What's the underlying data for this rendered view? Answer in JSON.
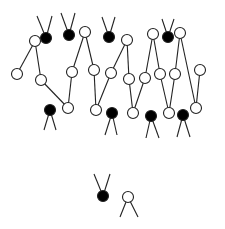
{
  "diagram": {
    "width": 225,
    "height": 229,
    "colors": {
      "stroke": "#222222",
      "black_fill": "#000000",
      "white_fill": "#ffffff",
      "background": "#ffffff"
    },
    "node_radius": 5.5,
    "nodes": [
      {
        "id": "b1",
        "x": 46,
        "y": 38,
        "fill": "black"
      },
      {
        "id": "b2",
        "x": 69,
        "y": 35,
        "fill": "black"
      },
      {
        "id": "b3",
        "x": 109,
        "y": 37,
        "fill": "black"
      },
      {
        "id": "b4",
        "x": 168,
        "y": 37,
        "fill": "black"
      },
      {
        "id": "w1",
        "x": 35,
        "y": 41,
        "fill": "white"
      },
      {
        "id": "w2",
        "x": 85,
        "y": 32,
        "fill": "white"
      },
      {
        "id": "w3",
        "x": 127,
        "y": 40,
        "fill": "white"
      },
      {
        "id": "w4",
        "x": 153,
        "y": 34,
        "fill": "white"
      },
      {
        "id": "w5",
        "x": 180,
        "y": 33,
        "fill": "white"
      },
      {
        "id": "w6",
        "x": 17,
        "y": 74,
        "fill": "white"
      },
      {
        "id": "w7",
        "x": 41,
        "y": 80,
        "fill": "white"
      },
      {
        "id": "w8",
        "x": 72,
        "y": 72,
        "fill": "white"
      },
      {
        "id": "w9",
        "x": 94,
        "y": 70,
        "fill": "white"
      },
      {
        "id": "w10",
        "x": 111,
        "y": 73,
        "fill": "white"
      },
      {
        "id": "w11",
        "x": 129,
        "y": 79,
        "fill": "white"
      },
      {
        "id": "w12",
        "x": 145,
        "y": 78,
        "fill": "white"
      },
      {
        "id": "w13",
        "x": 160,
        "y": 74,
        "fill": "white"
      },
      {
        "id": "w14",
        "x": 175,
        "y": 74,
        "fill": "white"
      },
      {
        "id": "w15",
        "x": 200,
        "y": 70,
        "fill": "white"
      },
      {
        "id": "w16",
        "x": 68,
        "y": 108,
        "fill": "white"
      },
      {
        "id": "w17",
        "x": 96,
        "y": 110,
        "fill": "white"
      },
      {
        "id": "w18",
        "x": 133,
        "y": 113,
        "fill": "white"
      },
      {
        "id": "w19",
        "x": 169,
        "y": 113,
        "fill": "white"
      },
      {
        "id": "w20",
        "x": 196,
        "y": 108,
        "fill": "white"
      },
      {
        "id": "b5",
        "x": 50,
        "y": 110,
        "fill": "black"
      },
      {
        "id": "b6",
        "x": 112,
        "y": 113,
        "fill": "black"
      },
      {
        "id": "b7",
        "x": 151,
        "y": 116,
        "fill": "black"
      },
      {
        "id": "b8",
        "x": 183,
        "y": 115,
        "fill": "black"
      },
      {
        "id": "b9",
        "x": 103,
        "y": 196,
        "fill": "black"
      },
      {
        "id": "w21",
        "x": 128,
        "y": 197,
        "fill": "white"
      }
    ],
    "edges": [
      [
        "w1",
        "w6"
      ],
      [
        "w1",
        "w7"
      ],
      [
        "w7",
        "w16"
      ],
      [
        "w16",
        "w8"
      ],
      [
        "w8",
        "w2"
      ],
      [
        "w2",
        "w9"
      ],
      [
        "w9",
        "w17"
      ],
      [
        "w17",
        "w10"
      ],
      [
        "w10",
        "w3"
      ],
      [
        "w3",
        "w11"
      ],
      [
        "w11",
        "w18"
      ],
      [
        "w18",
        "w12"
      ],
      [
        "w12",
        "w4"
      ],
      [
        "w4",
        "w13"
      ],
      [
        "w13",
        "w19"
      ],
      [
        "w19",
        "w14"
      ],
      [
        "w14",
        "w5"
      ],
      [
        "w5",
        "w20"
      ],
      [
        "w20",
        "w15"
      ]
    ],
    "stubs_up": [
      {
        "node": "b1",
        "dx1": -9,
        "dx2": 6,
        "len": 22
      },
      {
        "node": "b2",
        "dx1": -8,
        "dx2": 6,
        "len": 22
      },
      {
        "node": "b3",
        "dx1": -7,
        "dx2": 6,
        "len": 20
      },
      {
        "node": "b4",
        "dx1": -6,
        "dx2": 6,
        "len": 18
      },
      {
        "node": "b9",
        "dx1": -9,
        "dx2": 7,
        "len": 22
      }
    ],
    "stubs_down": [
      {
        "node": "b5",
        "dx1": -6,
        "dx2": 6,
        "len": 20
      },
      {
        "node": "b6",
        "dx1": -7,
        "dx2": 5,
        "len": 22
      },
      {
        "node": "b7",
        "dx1": -5,
        "dx2": 8,
        "len": 22
      },
      {
        "node": "b8",
        "dx1": -6,
        "dx2": 7,
        "len": 22
      },
      {
        "node": "w21",
        "dx1": -8,
        "dx2": 10,
        "len": 20
      }
    ]
  }
}
